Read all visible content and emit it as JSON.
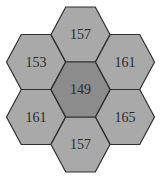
{
  "diagram": {
    "type": "hexagon-grid",
    "colors": {
      "outer_fill": "#a9a9a9",
      "center_fill": "#8c8c8c",
      "stroke": "#2f2f2f",
      "text": "#2a2a2a"
    },
    "cells": [
      {
        "position": "top",
        "value": "157"
      },
      {
        "position": "upper-left",
        "value": "153"
      },
      {
        "position": "upper-right",
        "value": "161"
      },
      {
        "position": "center",
        "value": "149"
      },
      {
        "position": "lower-left",
        "value": "161"
      },
      {
        "position": "lower-right",
        "value": "165"
      },
      {
        "position": "bottom",
        "value": "157"
      }
    ]
  }
}
